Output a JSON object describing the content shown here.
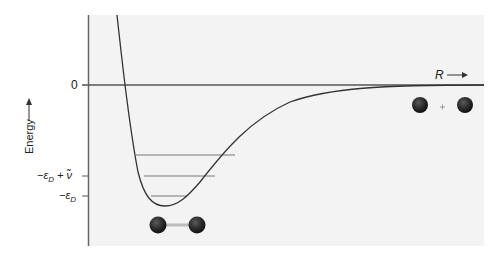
{
  "diagram": {
    "title": "",
    "y_axis": {
      "label": "Energy",
      "arrow": "up-arrow",
      "ticks": [
        {
          "label": "0",
          "y_px": 85
        },
        {
          "label": "−ε_D + ν̃",
          "y_px": 176
        },
        {
          "label": "−ε_D",
          "y_px": 196
        }
      ]
    },
    "x_axis": {
      "label": "R",
      "arrow": "right-arrow"
    },
    "tick_labels": {
      "zero": "0",
      "eps_plus_nu": "−ε",
      "eps_plus_nu_sub": "D",
      "eps_plus_nu_rest": " + ν̃",
      "eps": "−ε",
      "eps_sub": "D"
    },
    "curve": {
      "type": "potential-energy-well",
      "min_point_px": [
        157,
        206
      ],
      "asymptote": "0"
    },
    "vibrational_levels_px": [
      {
        "y": 155,
        "x1": 135,
        "x2": 236
      },
      {
        "y": 176,
        "x1": 143,
        "x2": 216
      },
      {
        "y": 196,
        "x1": 150,
        "x2": 188
      }
    ],
    "annotations": {
      "bound_molecule": "diatomic molecule",
      "separated_atoms_plus": "+"
    },
    "colors": {
      "panel": "#f3f3f3",
      "line": "#555555",
      "atom": "#2a2a2a",
      "bond": "#bcbcbc"
    }
  }
}
